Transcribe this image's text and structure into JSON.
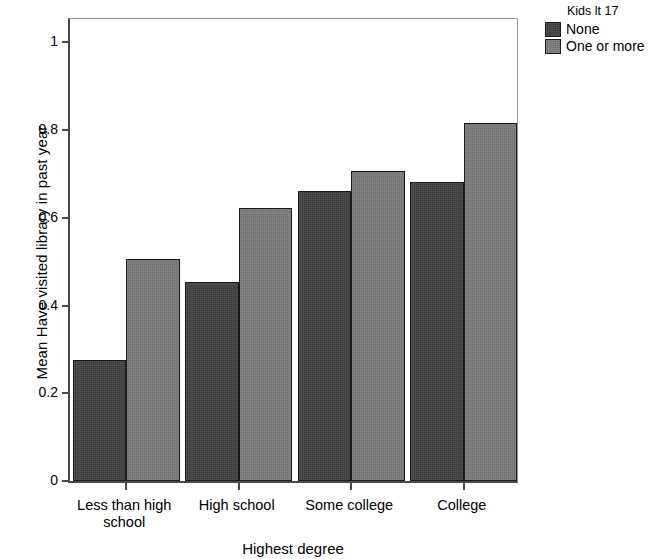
{
  "chart_data": {
    "type": "bar",
    "title": "",
    "xlabel": "Highest degree",
    "ylabel": "Mean Have visited library in past year",
    "categories": [
      "Less than high school",
      "High school",
      "Some college",
      "College"
    ],
    "category_lines": [
      [
        "Less than high",
        "school"
      ],
      [
        "High school"
      ],
      [
        "Some college"
      ],
      [
        "College"
      ]
    ],
    "series": [
      {
        "name": "None",
        "values": [
          0.277,
          0.454,
          0.661,
          0.682
        ],
        "color": "#3b3b3b"
      },
      {
        "name": "One or more",
        "values": [
          0.507,
          0.622,
          0.706,
          0.815
        ],
        "color": "#727272"
      }
    ],
    "ylim": [
      0,
      1.06
    ],
    "yticks": [
      0,
      0.2,
      0.4,
      0.6,
      0.8,
      1
    ],
    "ytick_labels": [
      "0",
      "0.2",
      "0.4",
      "0.6",
      "0.8",
      "1"
    ],
    "grid": false,
    "legend": {
      "title": "Kids lt 17",
      "position": "top-right",
      "entries": [
        "None",
        "One or more"
      ]
    }
  }
}
